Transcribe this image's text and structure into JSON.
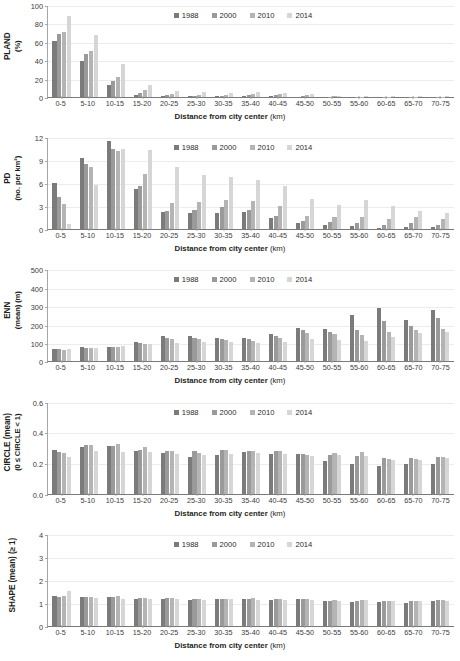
{
  "xlabel": "Distance from city center",
  "xlabel_unit": "(km)",
  "legend": [
    {
      "label": "1988",
      "color": "#7b7b7b"
    },
    {
      "label": "2000",
      "color": "#9a9a9a"
    },
    {
      "label": "2010",
      "color": "#b4b4b4"
    },
    {
      "label": "2014",
      "color": "#d6d6d6"
    }
  ],
  "categories": [
    "0-5",
    "5-10",
    "10-15",
    "15-20",
    "20-25",
    "25-30",
    "30-35",
    "35-40",
    "40-45",
    "45-50",
    "50-55",
    "55-60",
    "60-65",
    "65-70",
    "70-75"
  ],
  "chart_data": [
    {
      "type": "bar",
      "title": "",
      "ylabel": "PLAND (%)",
      "ylabel_main": "PLAND",
      "ylabel_unit": "(%)",
      "xlabel": "Distance from city center (km)",
      "ylim": [
        0,
        100
      ],
      "yticks": [
        0,
        20,
        40,
        60,
        80,
        100
      ],
      "grid": true,
      "legend_position": "top-center",
      "categories": [
        "0-5",
        "5-10",
        "10-15",
        "15-20",
        "20-25",
        "25-30",
        "30-35",
        "35-40",
        "40-45",
        "45-50",
        "50-55",
        "55-60",
        "60-65",
        "65-70",
        "70-75"
      ],
      "series": [
        {
          "name": "1988",
          "values": [
            61,
            39.5,
            13.5,
            2.5,
            1.0,
            0.6,
            0.7,
            1.5,
            1.5,
            0.5,
            0.3,
            0.2,
            0.2,
            0.2,
            0.2
          ]
        },
        {
          "name": "2000",
          "values": [
            68,
            47,
            17,
            4.5,
            1.8,
            1.2,
            1.5,
            2.5,
            2.2,
            1.0,
            0.5,
            0.3,
            0.3,
            0.3,
            0.3
          ]
        },
        {
          "name": "2010",
          "values": [
            71,
            50,
            22,
            7.5,
            3.5,
            2.5,
            2.5,
            3.5,
            3.0,
            1.8,
            0.8,
            0.5,
            0.4,
            0.4,
            0.4
          ]
        },
        {
          "name": "2014",
          "values": [
            88,
            67.5,
            36,
            13,
            6.0,
            5.0,
            4.0,
            5.5,
            4.5,
            3.0,
            1.5,
            0.8,
            0.6,
            0.6,
            0.6
          ]
        }
      ]
    },
    {
      "type": "bar",
      "title": "",
      "ylabel": "PD (no. per km²)",
      "ylabel_main": "PD",
      "ylabel_unit": "(no. per km²)",
      "xlabel": "Distance from city center (km)",
      "ylim": [
        0,
        12
      ],
      "yticks": [
        0,
        3,
        6,
        9,
        12
      ],
      "grid": true,
      "legend_position": "top-center",
      "categories": [
        "0-5",
        "5-10",
        "10-15",
        "15-20",
        "20-25",
        "25-30",
        "30-35",
        "35-40",
        "40-45",
        "45-50",
        "50-55",
        "55-60",
        "60-65",
        "65-70",
        "70-75"
      ],
      "series": [
        {
          "name": "1988",
          "values": [
            6.05,
            9.25,
            11.5,
            5.2,
            2.2,
            2.15,
            2.15,
            2.3,
            1.45,
            0.85,
            0.55,
            0.4,
            0.2,
            0.35,
            0.35
          ]
        },
        {
          "name": "2000",
          "values": [
            4.15,
            8.5,
            10.45,
            5.7,
            2.4,
            2.5,
            2.85,
            2.5,
            1.75,
            1.1,
            0.95,
            0.75,
            0.6,
            0.8,
            0.6
          ]
        },
        {
          "name": "2010",
          "values": [
            3.3,
            8.1,
            10.25,
            7.2,
            3.4,
            3.6,
            3.8,
            3.7,
            3.0,
            1.75,
            1.6,
            1.6,
            1.35,
            1.6,
            1.3
          ]
        },
        {
          "name": "2014",
          "values": [
            0.65,
            5.8,
            10.45,
            10.3,
            8.1,
            7.1,
            6.75,
            6.4,
            5.6,
            4.0,
            3.15,
            3.8,
            3.05,
            2.35,
            2.1
          ]
        }
      ]
    },
    {
      "type": "bar",
      "title": "",
      "ylabel": "ENN (mean) (m)",
      "ylabel_main": "ENN",
      "ylabel_unit": "(mean) (m)",
      "xlabel": "Distance from city center (km)",
      "ylim": [
        0,
        500
      ],
      "yticks": [
        0,
        100,
        200,
        300,
        400,
        500
      ],
      "grid": true,
      "legend_position": "top-center",
      "categories": [
        "0-5",
        "5-10",
        "10-15",
        "15-20",
        "20-25",
        "25-30",
        "30-35",
        "35-40",
        "40-45",
        "45-50",
        "50-55",
        "55-60",
        "60-65",
        "65-70",
        "70-75"
      ],
      "series": [
        {
          "name": "1988",
          "values": [
            66,
            76,
            78,
            105,
            138,
            140,
            128,
            128,
            150,
            182,
            178,
            250,
            288,
            225,
            278
          ]
        },
        {
          "name": "2000",
          "values": [
            66,
            75,
            79,
            98,
            128,
            128,
            122,
            123,
            140,
            168,
            158,
            173,
            218,
            195,
            238
          ]
        },
        {
          "name": "2010",
          "values": [
            64,
            72,
            78,
            94,
            124,
            120,
            115,
            112,
            128,
            155,
            148,
            143,
            158,
            172,
            178
          ]
        },
        {
          "name": "2014",
          "values": [
            68,
            74,
            82,
            95,
            100,
            103,
            105,
            100,
            108,
            122,
            118,
            112,
            130,
            152,
            162
          ]
        }
      ]
    },
    {
      "type": "bar",
      "title": "",
      "ylabel": "CIRCLE (mean) (0 ≤ CIRCLE < 1)",
      "ylabel_main": "CIRCLE (mean)",
      "ylabel_unit": "(0 ≤ CIRCLE < 1)",
      "xlabel": "Distance from city center (km)",
      "ylim": [
        0,
        0.6
      ],
      "yticks": [
        0.0,
        0.2,
        0.4,
        0.6
      ],
      "ytick_labels": [
        "0.0",
        "0.2",
        "0.4",
        "0.6"
      ],
      "grid": true,
      "legend_position": "top-center",
      "categories": [
        "0-5",
        "5-10",
        "10-15",
        "15-20",
        "20-25",
        "25-30",
        "30-35",
        "35-40",
        "40-45",
        "45-50",
        "50-55",
        "55-60",
        "60-65",
        "65-70",
        "70-75"
      ],
      "series": [
        {
          "name": "1988",
          "values": [
            0.282,
            0.307,
            0.312,
            0.279,
            0.263,
            0.241,
            0.253,
            0.268,
            0.256,
            0.258,
            0.213,
            0.193,
            0.178,
            0.194,
            0.194
          ]
        },
        {
          "name": "2000",
          "values": [
            0.269,
            0.316,
            0.311,
            0.281,
            0.276,
            0.277,
            0.281,
            0.276,
            0.276,
            0.259,
            0.249,
            0.243,
            0.231,
            0.23,
            0.238
          ]
        },
        {
          "name": "2010",
          "values": [
            0.263,
            0.318,
            0.321,
            0.307,
            0.276,
            0.266,
            0.283,
            0.279,
            0.28,
            0.249,
            0.264,
            0.269,
            0.226,
            0.223,
            0.241
          ]
        },
        {
          "name": "2014",
          "values": [
            0.241,
            0.276,
            0.268,
            0.269,
            0.258,
            0.254,
            0.259,
            0.262,
            0.258,
            0.243,
            0.251,
            0.248,
            0.221,
            0.216,
            0.234
          ]
        }
      ]
    },
    {
      "type": "bar",
      "title": "",
      "ylabel": "SHAPE (mean) (≥ 1)",
      "ylabel_main": "SHAPE (mean) (≥ 1)",
      "ylabel_unit": "",
      "xlabel": "Distance from city center (km)",
      "ylim": [
        0,
        4
      ],
      "yticks": [
        0,
        1,
        2,
        3,
        4
      ],
      "grid": true,
      "legend_position": "top-center",
      "categories": [
        "0-5",
        "5-10",
        "10-15",
        "15-20",
        "20-25",
        "25-30",
        "30-35",
        "35-40",
        "40-45",
        "45-50",
        "50-55",
        "55-60",
        "60-65",
        "65-70",
        "70-75"
      ],
      "series": [
        {
          "name": "1988",
          "values": [
            1.31,
            1.27,
            1.27,
            1.18,
            1.18,
            1.13,
            1.15,
            1.15,
            1.14,
            1.17,
            1.06,
            1.03,
            1.03,
            1.0,
            1.07
          ]
        },
        {
          "name": "2000",
          "values": [
            1.27,
            1.27,
            1.26,
            1.21,
            1.2,
            1.16,
            1.18,
            1.18,
            1.17,
            1.17,
            1.09,
            1.08,
            1.06,
            1.07,
            1.1
          ]
        },
        {
          "name": "2010",
          "values": [
            1.28,
            1.27,
            1.3,
            1.21,
            1.2,
            1.15,
            1.18,
            1.19,
            1.18,
            1.16,
            1.1,
            1.12,
            1.07,
            1.08,
            1.1
          ]
        },
        {
          "name": "2014",
          "values": [
            1.49,
            1.2,
            1.18,
            1.15,
            1.15,
            1.12,
            1.15,
            1.14,
            1.13,
            1.11,
            1.09,
            1.11,
            1.06,
            1.07,
            1.08
          ]
        }
      ]
    }
  ]
}
